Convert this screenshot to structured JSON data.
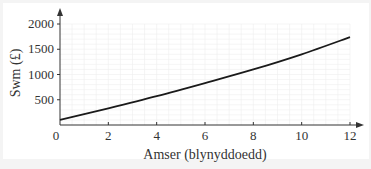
{
  "chart_data": {
    "type": "line",
    "title": "",
    "xlabel": "Amser (blynyddoedd)",
    "ylabel": "Swm (£)",
    "xlim": [
      0,
      12
    ],
    "ylim": [
      0,
      2000
    ],
    "x_ticks": [
      0,
      2,
      4,
      6,
      8,
      10,
      12
    ],
    "y_ticks": [
      0,
      500,
      1000,
      1500,
      2000
    ],
    "grid": true,
    "legend": null,
    "series": [
      {
        "name": "Swm",
        "x": [
          0,
          2,
          4,
          6,
          8,
          10,
          12
        ],
        "values": [
          100,
          330,
          570,
          830,
          1100,
          1400,
          1740
        ]
      }
    ]
  },
  "colors": {
    "background": "#f4f4f4",
    "panel": "#ffffff",
    "line": "#1a1a1a",
    "grid": "#eeeeee",
    "axis": "#333333"
  }
}
